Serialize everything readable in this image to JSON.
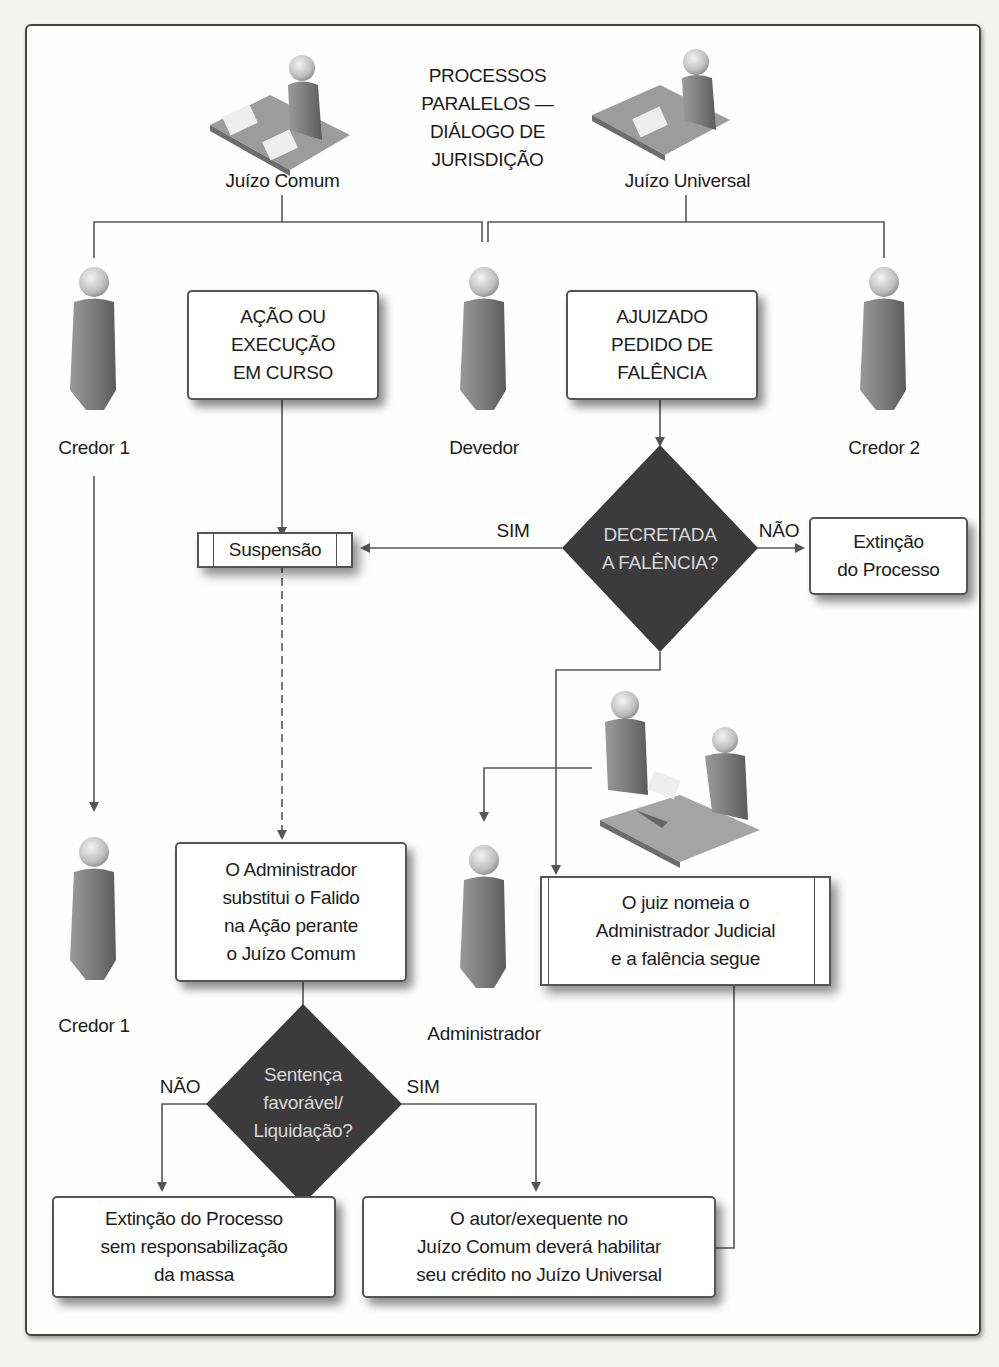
{
  "diagram": {
    "title": [
      "PROCESSOS",
      "PARALELOS —",
      "DIÁLOGO DE",
      "JURISDIÇÃO"
    ],
    "icons": {
      "juizo_comum": "judge-at-desk-icon",
      "juizo_universal": "judge-at-desk-icon",
      "person": "person-icon",
      "meeting": "two-people-meeting-icon"
    },
    "actors": {
      "juizo_comum": "Juízo Comum",
      "juizo_universal": "Juízo Universal",
      "credor1": "Credor 1",
      "devedor": "Devedor",
      "credor2": "Credor 2",
      "credor1_bottom": "Credor 1",
      "administrador": "Administrador"
    },
    "boxes": {
      "acao": [
        "AÇÃO OU",
        "EXECUÇÃO",
        "EM CURSO"
      ],
      "ajuizado": [
        "AJUIZADO",
        "PEDIDO DE",
        "FALÊNCIA"
      ],
      "suspensao": "Suspensão",
      "extincao_top": [
        "Extinção",
        "do Processo"
      ],
      "administrador_substitui": [
        "O Administrador",
        "substitui o Falido",
        "na Ação perante",
        "o Juízo Comum"
      ],
      "juiz_nomeia": [
        "O juiz nomeia o",
        "Administrador Judicial",
        "e a falência segue"
      ],
      "extincao_bottom": [
        "Extinção do Processo",
        "sem responsabilização",
        "da massa"
      ],
      "autor_habilitar": [
        "O autor/exequente no",
        "Juízo Comum deverá habilitar",
        "seu crédito no Juízo Universal"
      ]
    },
    "decisions": {
      "decretada": {
        "text": [
          "DECRETADA",
          "A FALÊNCIA?"
        ],
        "yes": "SIM",
        "no": "NÃO"
      },
      "sentenca": {
        "text": [
          "Sentença",
          "favorável/",
          "Liquidação?"
        ],
        "yes": "SIM",
        "no": "NÃO"
      }
    },
    "colors": {
      "diamond_fill": "#3b3b3b",
      "line": "#555555",
      "box_border": "#555555",
      "frame_border": "#444444"
    }
  }
}
